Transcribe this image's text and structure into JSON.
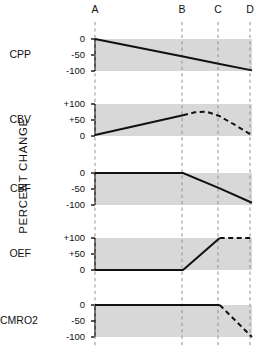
{
  "figure": {
    "y_axis_title": "PERCENT CHANGE",
    "phase_markers": [
      {
        "label": "A",
        "x": 95
      },
      {
        "label": "B",
        "x": 182
      },
      {
        "label": "C",
        "x": 218
      },
      {
        "label": "D",
        "x": 250
      }
    ]
  },
  "chart_data": {
    "type": "line",
    "title": "",
    "xlabel": "",
    "ylabel": "PERCENT CHANGE",
    "grid": false,
    "legend": "none",
    "x_markers": [
      "A",
      "B",
      "C",
      "D"
    ],
    "x_marker_positions": [
      0,
      60,
      85,
      107
    ],
    "xlim": [
      0,
      107
    ],
    "panels": [
      {
        "name": "CPP",
        "label": "CPP",
        "ylim": [
          -100,
          0
        ],
        "ytick_labels": [
          "0",
          "-50",
          "-100"
        ],
        "ytick_values": [
          0,
          -50,
          -100
        ],
        "band_top": 0,
        "band_bottom": -100,
        "segments": [
          {
            "style": "solid",
            "points": [
              [
                0,
                0
              ],
              [
                60,
                -55
              ],
              [
                85,
                -78
              ],
              [
                107,
                -98
              ]
            ]
          }
        ]
      },
      {
        "name": "CBV",
        "label": "CBV",
        "ylim": [
          0,
          100
        ],
        "ytick_labels": [
          "+100",
          "+50",
          "0"
        ],
        "ytick_values": [
          100,
          50,
          0
        ],
        "band_top": 100,
        "band_bottom": 0,
        "segments": [
          {
            "style": "solid",
            "points": [
              [
                0,
                3
              ],
              [
                60,
                65
              ]
            ]
          },
          {
            "style": "dashed",
            "points": [
              [
                60,
                65
              ],
              [
                68,
                74
              ],
              [
                76,
                76
              ],
              [
                85,
                62
              ],
              [
                96,
                33
              ],
              [
                107,
                2
              ]
            ]
          }
        ]
      },
      {
        "name": "CBF",
        "label": "CBF",
        "ylim": [
          -100,
          0
        ],
        "ytick_labels": [
          "0",
          "-50",
          "-100"
        ],
        "ytick_values": [
          0,
          -50,
          -100
        ],
        "band_top": 0,
        "band_bottom": -100,
        "segments": [
          {
            "style": "solid",
            "points": [
              [
                0,
                0
              ],
              [
                60,
                0
              ],
              [
                85,
                -48
              ],
              [
                107,
                -93
              ]
            ]
          }
        ]
      },
      {
        "name": "OEF",
        "label": "OEF",
        "ylim": [
          0,
          100
        ],
        "ytick_labels": [
          "+100",
          "+50",
          "0"
        ],
        "ytick_values": [
          100,
          50,
          0
        ],
        "band_top": 100,
        "band_bottom": 0,
        "segments": [
          {
            "style": "solid",
            "points": [
              [
                0,
                0
              ],
              [
                60,
                0
              ],
              [
                85,
                100
              ]
            ]
          },
          {
            "style": "dashed",
            "points": [
              [
                85,
                100
              ],
              [
                107,
                100
              ]
            ]
          }
        ]
      },
      {
        "name": "CMRO2",
        "label": "CMRO2",
        "ylim": [
          -100,
          0
        ],
        "ytick_labels": [
          "0",
          "-50",
          "-100"
        ],
        "ytick_values": [
          0,
          -50,
          -100
        ],
        "band_top": 0,
        "band_bottom": -100,
        "segments": [
          {
            "style": "solid",
            "points": [
              [
                0,
                0
              ],
              [
                85,
                0
              ]
            ]
          },
          {
            "style": "dashed",
            "points": [
              [
                85,
                0
              ],
              [
                107,
                -100
              ]
            ]
          }
        ]
      }
    ]
  },
  "style": {
    "band_color": "#d8d8d8",
    "line_color": "#111111",
    "marker_line_color": "#9a9a9a",
    "text_color": "#111111"
  }
}
